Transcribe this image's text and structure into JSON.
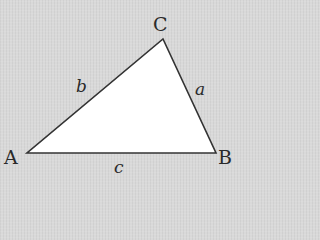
{
  "diagram": {
    "type": "triangle",
    "fill": "#ffffff",
    "stroke": "#333333",
    "background": "#d9d9d9",
    "vertices": {
      "A": {
        "label": "A",
        "x": 27,
        "y": 153
      },
      "B": {
        "label": "B",
        "x": 216,
        "y": 153
      },
      "C": {
        "label": "C",
        "x": 163,
        "y": 39
      }
    },
    "sides": {
      "a": {
        "label": "a",
        "between": "B-C"
      },
      "b": {
        "label": "b",
        "between": "A-C"
      },
      "c": {
        "label": "c",
        "between": "A-B"
      }
    }
  }
}
